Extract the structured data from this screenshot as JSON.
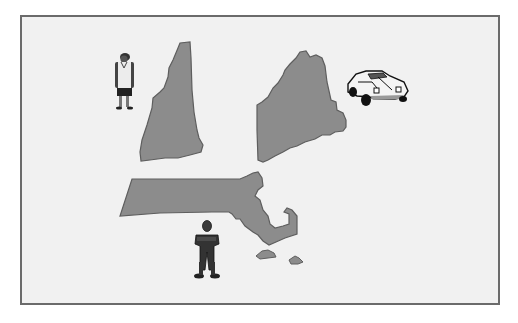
{
  "figure": {
    "states": [
      {
        "name": "New Hampshire",
        "id": "nh"
      },
      {
        "name": "Maine",
        "id": "me"
      },
      {
        "name": "Massachusetts",
        "id": "ma"
      }
    ],
    "figures": [
      {
        "id": "woman",
        "label": "woman-figure"
      },
      {
        "id": "man",
        "label": "man-figure"
      },
      {
        "id": "car",
        "label": "car"
      }
    ],
    "colors": {
      "state_fill": "#8c8c8c",
      "state_stroke": "#5e5e5e",
      "background": "#f1f1f1",
      "frame_border": "#6b6b6b"
    }
  }
}
